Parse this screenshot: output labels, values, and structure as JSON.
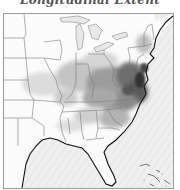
{
  "title": "Longitudinal Extent",
  "map": {
    "region": "Eastern United States",
    "style": "grayscale intensity overlay",
    "colors": {
      "ocean": "#f2f2f2",
      "land": "#fbfbfb",
      "border": "#7a7a7a",
      "coast": "#111111",
      "low": "#d8d8d8",
      "mid": "#9a9a9a",
      "high": "#3a3a3a"
    }
  }
}
